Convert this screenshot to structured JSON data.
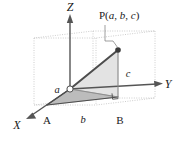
{
  "figure": {
    "axes": [
      {
        "name": "z-axis",
        "label": "Z"
      },
      {
        "name": "y-axis",
        "label": "Y"
      },
      {
        "name": "x-axis",
        "label": "X"
      }
    ],
    "point_label": {
      "prefix": "P(",
      "coord_a": "a",
      "sep1": ", ",
      "coord_b": "b",
      "sep2": ", ",
      "coord_c": "c",
      "suffix": ")",
      "full": "P(a, b, c)"
    },
    "vertices": [
      {
        "name": "vertex-a",
        "label": "A"
      },
      {
        "name": "vertex-b",
        "label": "B"
      }
    ],
    "lengths": [
      {
        "name": "length-a",
        "label": "a"
      },
      {
        "name": "length-b",
        "label": "b"
      },
      {
        "name": "length-c",
        "label": "c"
      }
    ],
    "markers": {
      "origin": "open-circle",
      "point_p": "filled-dot",
      "right_angle": "square"
    },
    "colors": {
      "stroke": "#4d4d4d",
      "axis": "#555555",
      "box_guide": "#b3b3b3",
      "floor_triangle_fill": "#bfbfbf",
      "vertical_triangle_fill": "#e0e0e0",
      "text": "#1a1a1a",
      "background": "#ffffff"
    }
  }
}
